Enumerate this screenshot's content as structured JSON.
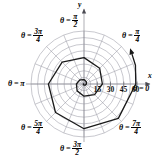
{
  "figure": {
    "name": "polar-spiral-plot",
    "background_color": "#ffffff",
    "curve_color": "#1a1a1a",
    "grid_color": "#9a9aa5",
    "axis_color": "#8c8c96",
    "label_color": "#000000"
  },
  "axes": {
    "y_label": "y",
    "x_label": "x",
    "center_x": 84,
    "center_y": 84,
    "outer_radius": 53
  },
  "angle_labels": [
    {
      "id": "theta-0",
      "prefix": "θ =",
      "value": "0",
      "kind": "plain",
      "degrees": 0
    },
    {
      "id": "theta-pi-4",
      "prefix": "θ =",
      "num": "π",
      "den": "4",
      "kind": "fraction",
      "degrees": 45
    },
    {
      "id": "theta-pi-2",
      "prefix": "θ =",
      "num": "π",
      "den": "2",
      "kind": "fraction",
      "degrees": 90
    },
    {
      "id": "theta-3pi-4",
      "prefix": "θ =",
      "num": "3π",
      "den": "4",
      "kind": "fraction",
      "degrees": 135
    },
    {
      "id": "theta-pi",
      "prefix": "θ =",
      "value": "π",
      "kind": "plain",
      "degrees": 180
    },
    {
      "id": "theta-5pi-4",
      "prefix": "θ =",
      "num": "5π",
      "den": "4",
      "kind": "fraction",
      "degrees": 225
    },
    {
      "id": "theta-3pi-2",
      "prefix": "θ =",
      "num": "3π",
      "den": "2",
      "kind": "fraction",
      "degrees": 270
    },
    {
      "id": "theta-7pi-4",
      "prefix": "θ =",
      "num": "7π",
      "den": "4",
      "kind": "fraction",
      "degrees": 315
    }
  ],
  "radial_ticks": {
    "labels": [
      "15",
      "30",
      "45",
      "60"
    ],
    "values": [
      15,
      30,
      45,
      60
    ]
  },
  "chart_data": {
    "type": "line",
    "title": "",
    "subtitle": "",
    "xlabel": "x",
    "ylabel": "y",
    "coordinate_system": "polar",
    "grid": true,
    "legend": null,
    "axis_angle_labels": [
      "θ = 0",
      "θ = π/4",
      "θ = π/2",
      "θ = 3π/4",
      "θ = π",
      "θ = 5π/4",
      "θ = 3π/2",
      "θ = 7π/4"
    ],
    "radial_tick_labels": [
      "15",
      "30",
      "45",
      "60"
    ],
    "rlim": [
      0,
      60
    ],
    "grid_circles": 8,
    "grid_circle_values": [
      7.5,
      15,
      22.5,
      30,
      37.5,
      45,
      52.5,
      60
    ],
    "grid_spokes": 16,
    "grid_spoke_step_degrees": 22.5,
    "series": [
      {
        "name": "spiral",
        "kind": "polar-spiral",
        "direction": "outward-clockwise",
        "arrow_at_end": true,
        "description": "Spiral growing outward from the pole, sweeping clockwise and terminating with an arrowhead beyond r = 60 near theta = 0",
        "theta_degrees": [
          -900,
          -855,
          -810,
          -765,
          -720,
          -675,
          -630,
          -585,
          -540,
          -495,
          -450,
          -405,
          -360,
          -315,
          -270,
          -225,
          -180,
          -135,
          -90,
          -45,
          0,
          20,
          35
        ],
        "r_values": [
          0.6,
          0.9,
          1.3,
          1.9,
          2.7,
          3.7,
          5.0,
          6.6,
          8.6,
          11.0,
          13.8,
          17.0,
          20.8,
          25.1,
          29.9,
          35.0,
          40.3,
          45.6,
          50.6,
          55.0,
          58.6,
          62.0,
          65.0
        ]
      }
    ]
  }
}
